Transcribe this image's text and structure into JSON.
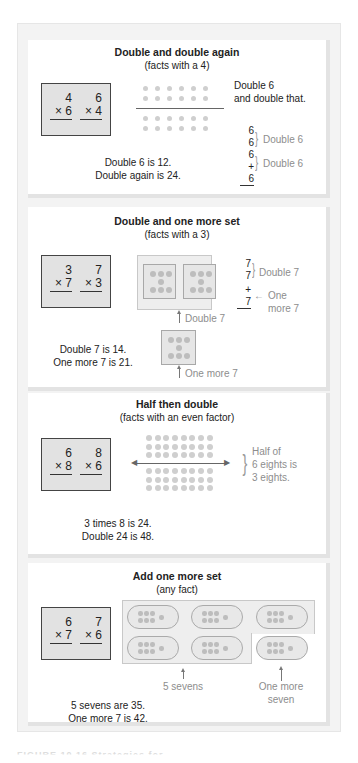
{
  "panels": [
    {
      "title": "Double and double again",
      "subtitle": "(facts with a 4)",
      "facts": [
        {
          "top": "4",
          "bottom": "× 6"
        },
        {
          "top": "6",
          "bottom": "× 4"
        }
      ],
      "note": "Double 6\nand double that.",
      "column": [
        "6",
        "6",
        "6",
        "+ 6"
      ],
      "brace_labels": [
        "Double 6",
        "Double 6"
      ],
      "summary": [
        "Double 6 is 12.",
        "Double again is 24."
      ],
      "dot_rows": 4,
      "dot_cols": 6
    },
    {
      "title": "Double and one more set",
      "subtitle": "(facts with a 3)",
      "facts": [
        {
          "top": "3",
          "bottom": "× 7"
        },
        {
          "top": "7",
          "bottom": "× 3"
        }
      ],
      "column": [
        "7",
        "7",
        "+ 7"
      ],
      "brace_labels": [
        "Double 7"
      ],
      "arrow_label": [
        "One",
        "more 7"
      ],
      "pointer_labels": [
        "Double 7",
        "One more 7"
      ],
      "summary": [
        "Double 7 is 14.",
        "One more 7 is 21."
      ]
    },
    {
      "title": "Half then double",
      "subtitle": "(facts with an even factor)",
      "facts": [
        {
          "top": "6",
          "bottom": "× 8"
        },
        {
          "top": "8",
          "bottom": "× 6"
        }
      ],
      "brace_note": [
        "Half of",
        "6 eights is",
        "3 eights."
      ],
      "summary": [
        "3 times 8 is 24.",
        "Double 24 is 48."
      ],
      "dot_rows": 6,
      "dot_cols": 8
    },
    {
      "title": "Add one more set",
      "subtitle": "(any fact)",
      "facts": [
        {
          "top": "6",
          "bottom": "× 7"
        },
        {
          "top": "7",
          "bottom": "× 6"
        }
      ],
      "pointer_labels": [
        "5 sevens",
        "One more\nseven"
      ],
      "summary": [
        "5 sevens are 35.",
        "One more 7 is 42."
      ]
    }
  ],
  "caption": "FIGURE 10.16  Strategies for ..."
}
